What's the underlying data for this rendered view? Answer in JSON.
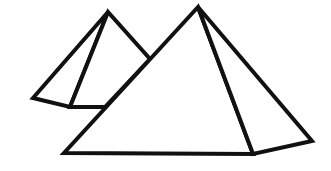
{
  "image": {
    "subject": "Two pyramids line drawing",
    "background": "#ffffff",
    "stroke_color": "#111111",
    "stroke_width": 4
  },
  "shapes": {
    "small_pyramid": {
      "label": "Small pyramid (background)",
      "apex": [
        108,
        12
      ],
      "base_left": [
        33,
        98
      ],
      "base_front": [
        70,
        107
      ],
      "base_right_hidden": [
        105,
        107
      ],
      "right_edge_end": [
        150,
        59
      ]
    },
    "large_pyramid": {
      "label": "Large pyramid (foreground)",
      "apex": [
        198,
        7
      ],
      "base_left": [
        64,
        153
      ],
      "base_front": [
        253,
        154
      ],
      "base_right": [
        312,
        141
      ]
    }
  }
}
